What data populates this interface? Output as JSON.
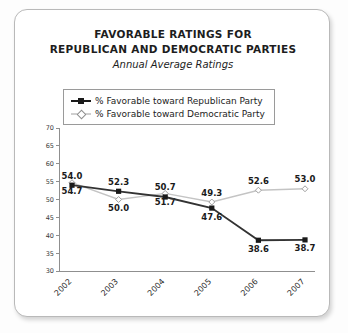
{
  "card": {
    "title_line_1": "FAVORABLE RATINGS FOR",
    "title_line_2": "REPUBLICAN AND DEMOCRATIC PARTIES",
    "subtitle": "Annual Average Ratings"
  },
  "legend": {
    "items": [
      {
        "label": "% Favorable toward Republican Party",
        "marker": "filled-square-icon",
        "color": "#1a1a1a"
      },
      {
        "label": "% Favorable toward Democratic Party",
        "marker": "open-diamond-icon",
        "color": "#bdbdbd"
      }
    ]
  },
  "chart_data": {
    "type": "line",
    "title": "FAVORABLE RATINGS FOR REPUBLICAN AND DEMOCRATIC PARTIES",
    "subtitle": "Annual Average Ratings",
    "xlabel": "",
    "ylabel": "",
    "categories": [
      "2002",
      "2003",
      "2004",
      "2005",
      "2006",
      "2007"
    ],
    "ylim": [
      30,
      70
    ],
    "yticks": [
      30,
      35,
      40,
      45,
      50,
      55,
      60,
      65,
      70
    ],
    "grid": false,
    "legend_position": "top",
    "series": [
      {
        "name": "% Favorable toward Republican Party",
        "color": "#333333",
        "marker": "filled-square",
        "values": [
          54.0,
          52.3,
          50.7,
          47.6,
          38.6,
          38.7
        ],
        "labels": [
          "54.0",
          "52.3",
          "50.7",
          "47.6",
          "38.6",
          "38.7"
        ],
        "label_positions": [
          "above",
          "above",
          "above",
          "below",
          "below",
          "below"
        ]
      },
      {
        "name": "% Favorable toward Democratic Party",
        "color": "#c4c4c4",
        "marker": "open-diamond",
        "values": [
          54.7,
          50.0,
          51.7,
          49.3,
          52.6,
          53.0
        ],
        "labels": [
          "54.7",
          "50.0",
          "51.7",
          "49.3",
          "52.6",
          "53.0"
        ],
        "label_positions": [
          "below",
          "below",
          "below",
          "above",
          "above",
          "above"
        ]
      }
    ]
  }
}
